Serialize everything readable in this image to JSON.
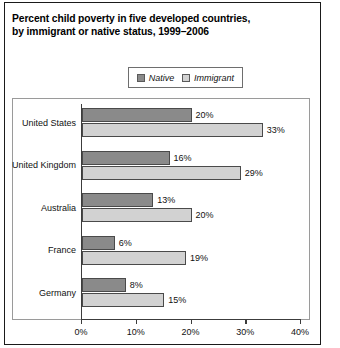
{
  "title": {
    "line1": "Percent child poverty in five developed countries,",
    "line2": "by immigrant or native status, 1999–2006"
  },
  "legend": {
    "native_label": "Native",
    "immigrant_label": "Immigrant",
    "native_color": "#8a8a8a",
    "immigrant_color": "#d2d2d2"
  },
  "axis": {
    "ticks": [
      "0%",
      "10%",
      "20%",
      "30%",
      "40%"
    ]
  },
  "chart_data": {
    "type": "bar",
    "orientation": "horizontal",
    "title": "Percent child poverty in five developed countries, by immigrant or native status, 1999–2006",
    "xlabel": "",
    "ylabel": "",
    "xlim": [
      0,
      40
    ],
    "xticks": [
      0,
      10,
      20,
      30,
      40
    ],
    "xtick_labels": [
      "0%",
      "10%",
      "20%",
      "30%",
      "40%"
    ],
    "grid": false,
    "legend_position": "top-center",
    "categories": [
      "United States",
      "United Kingdom",
      "Australia",
      "France",
      "Germany"
    ],
    "series": [
      {
        "name": "Native",
        "color": "#8a8a8a",
        "values": [
          20,
          16,
          13,
          6,
          8
        ],
        "labels": [
          "20%",
          "16%",
          "13%",
          "6%",
          "8%"
        ]
      },
      {
        "name": "Immigrant",
        "color": "#d2d2d2",
        "values": [
          33,
          29,
          20,
          19,
          15
        ],
        "labels": [
          "33%",
          "29%",
          "20%",
          "19%",
          "15%"
        ]
      }
    ]
  }
}
